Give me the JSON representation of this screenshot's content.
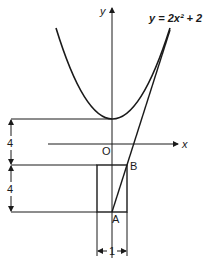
{
  "diagram": {
    "equation": "y = 2x² + 2",
    "axis_labels": {
      "x": "x",
      "y": "y",
      "origin": "O"
    },
    "points": {
      "A": "A",
      "B": "B"
    },
    "dimensions": {
      "upper_height": "4",
      "lower_height": "4",
      "width": "1"
    },
    "colors": {
      "stroke": "#1a1a1a",
      "background": "#ffffff"
    }
  }
}
